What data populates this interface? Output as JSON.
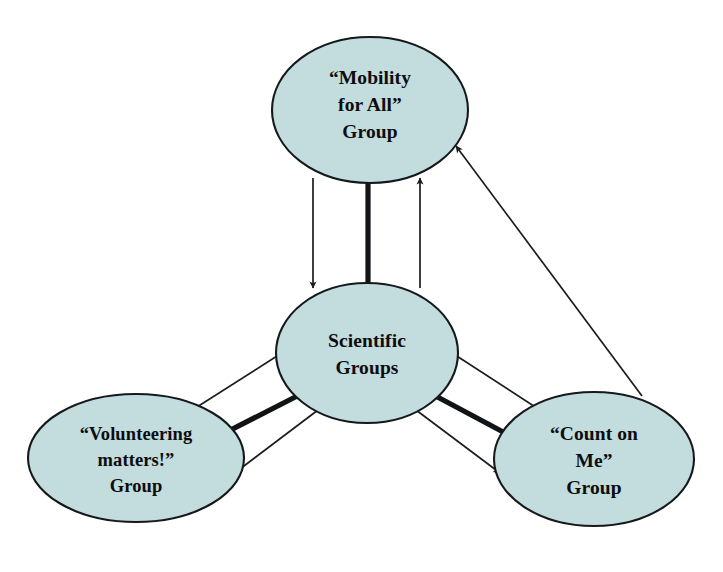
{
  "diagram": {
    "background_color": "#ffffff",
    "node_fill_color": "#c3dcdd",
    "node_stroke_color": "#16191c",
    "edge_color": "#1a1d20",
    "nodes": [
      {
        "id": "mobility",
        "lines": [
          "“Mobility",
          "for All”",
          "Group"
        ],
        "cx": 370,
        "cy": 110,
        "rx": 98,
        "ry": 73
      },
      {
        "id": "scientific",
        "lines": [
          "Scientific",
          "Groups"
        ],
        "cx": 367,
        "cy": 353,
        "rx": 91,
        "ry": 70
      },
      {
        "id": "volunteering",
        "lines": [
          "“Volunteering",
          "matters!”",
          "Group"
        ],
        "cx": 136,
        "cy": 458,
        "rx": 108,
        "ry": 64
      },
      {
        "id": "counton",
        "lines": [
          "“Count on",
          "Me”",
          "Group"
        ],
        "cx": 594,
        "cy": 459,
        "rx": 100,
        "ry": 67
      }
    ],
    "edges": [
      {
        "id": "mobility-to-scientific",
        "style": "thin-arrow",
        "from": "mobility",
        "to": "scientific"
      },
      {
        "id": "mobility-scientific-link",
        "style": "thick-line",
        "from": "mobility",
        "to": "scientific"
      },
      {
        "id": "scientific-to-mobility",
        "style": "thin-arrow",
        "from": "scientific",
        "to": "mobility"
      },
      {
        "id": "volunteering-to-scientific",
        "style": "thin-arrow",
        "from": "volunteering",
        "to": "scientific"
      },
      {
        "id": "volunteering-scientific-link",
        "style": "thick-line",
        "from": "volunteering",
        "to": "scientific"
      },
      {
        "id": "scientific-to-volunteering",
        "style": "thin-arrow",
        "from": "scientific",
        "to": "volunteering"
      },
      {
        "id": "counton-to-scientific",
        "style": "thin-arrow",
        "from": "counton",
        "to": "scientific"
      },
      {
        "id": "counton-scientific-link",
        "style": "thick-line",
        "from": "counton",
        "to": "scientific"
      },
      {
        "id": "scientific-to-counton",
        "style": "thin-arrow",
        "from": "scientific",
        "to": "counton"
      },
      {
        "id": "counton-to-mobility",
        "style": "thin-arrow",
        "from": "counton",
        "to": "mobility"
      }
    ]
  }
}
